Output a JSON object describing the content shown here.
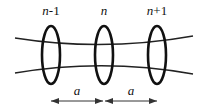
{
  "diagram": {
    "nodes": [
      {
        "label_var": "n",
        "label_suffix": "-1",
        "cx": 51
      },
      {
        "label_var": "n",
        "label_suffix": "",
        "cx": 104
      },
      {
        "label_var": "n",
        "label_suffix": "+1",
        "cx": 157
      }
    ],
    "spacings": [
      {
        "label": "a"
      },
      {
        "label": "a"
      }
    ],
    "colors": {
      "stroke": "#111111",
      "background": "#ffffff"
    }
  }
}
